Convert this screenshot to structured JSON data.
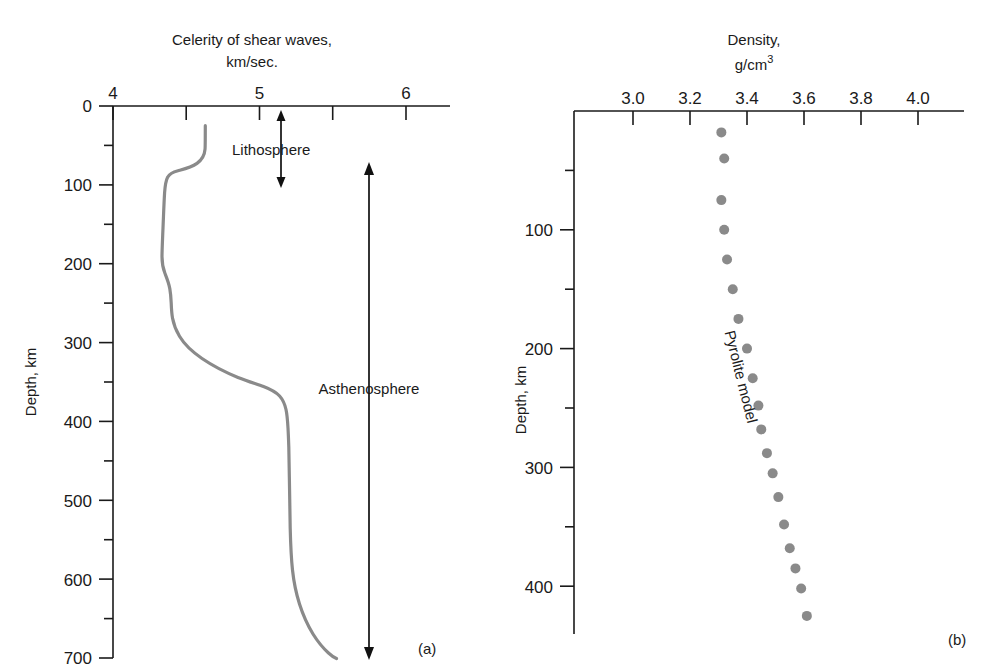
{
  "figure": {
    "panel_a_label": "(a)",
    "panel_b_label": "(b)"
  },
  "panel_a": {
    "title_line1": "Celerity of shear waves,",
    "title_line2": "km/sec.",
    "y_axis_label": "Depth, km",
    "x_ticks": [
      "4",
      "5",
      "6"
    ],
    "y_ticks": [
      "0",
      "100",
      "200",
      "300",
      "400",
      "500",
      "600",
      "700"
    ],
    "annotations": {
      "lithosphere": "Lithosphere",
      "asthenosphere": "Asthenosphere"
    }
  },
  "panel_b": {
    "title_line1": "Density,",
    "title_line2": "g/cm",
    "title_sup": "3",
    "y_axis_label": "Depth, km",
    "x_ticks": [
      "3.0",
      "3.2",
      "3.4",
      "3.6",
      "3.8",
      "4.0"
    ],
    "y_ticks": [
      "100",
      "200",
      "300",
      "400"
    ],
    "series_label": "Pyrolite model"
  },
  "colors": {
    "axis": "#1a1a1a",
    "curve": "#8a8a8a",
    "dot": "#8a8a8a",
    "background": "#ffffff"
  },
  "chart_data": [
    {
      "type": "line",
      "title": "Celerity of shear waves, km/sec.",
      "xlabel": "Celerity of shear waves, km/sec.",
      "ylabel": "Depth, km",
      "xlim": [
        4,
        6
      ],
      "ylim": [
        0,
        700
      ],
      "y_inverted": true,
      "grid": false,
      "legend": "none",
      "x_major_ticks": [
        4,
        5,
        6
      ],
      "x_minor_ticks": [
        4.5,
        5.5
      ],
      "y_major_ticks": [
        0,
        100,
        200,
        300,
        400,
        500,
        600,
        700
      ],
      "y_minor_ticks": [
        50,
        150,
        250,
        350,
        450,
        550,
        650
      ],
      "series": [
        {
          "name": "Shear wave velocity",
          "points": [
            [
              4.63,
              25
            ],
            [
              4.63,
              55
            ],
            [
              4.6,
              68
            ],
            [
              4.5,
              76
            ],
            [
              4.38,
              82
            ],
            [
              4.34,
              90
            ],
            [
              4.32,
              105
            ],
            [
              4.3,
              130
            ],
            [
              4.28,
              160
            ],
            [
              4.28,
              190
            ],
            [
              4.3,
              215
            ],
            [
              4.32,
              245
            ],
            [
              4.33,
              275
            ],
            [
              4.34,
              300
            ],
            [
              4.38,
              330
            ],
            [
              4.48,
              360
            ],
            [
              4.62,
              385
            ],
            [
              4.8,
              405
            ],
            [
              4.96,
              425
            ],
            [
              5.06,
              450
            ],
            [
              5.12,
              480
            ],
            [
              5.16,
              520
            ],
            [
              5.19,
              570
            ],
            [
              5.22,
              610
            ],
            [
              5.27,
              650
            ],
            [
              5.38,
              680
            ],
            [
              5.53,
              698
            ]
          ]
        }
      ],
      "annotations": [
        {
          "text": "Lithosphere",
          "depth_range": [
            0,
            80
          ]
        },
        {
          "text": "Asthenosphere",
          "depth_range": [
            80,
            700
          ]
        }
      ]
    },
    {
      "type": "scatter",
      "title": "Density, g/cm3",
      "xlabel": "Density, g/cm3",
      "ylabel": "Depth, km",
      "xlim": [
        2.9,
        4.1
      ],
      "ylim": [
        0,
        440
      ],
      "y_inverted": true,
      "grid": false,
      "legend": "none",
      "x_major_ticks": [
        3.0,
        3.2,
        3.4,
        3.6,
        3.8,
        4.0
      ],
      "y_major_ticks": [
        100,
        200,
        300,
        400
      ],
      "y_minor_ticks": [
        50,
        150,
        250,
        350
      ],
      "series": [
        {
          "name": "Pyrolite model",
          "x": [
            3.31,
            3.32,
            3.31,
            3.32,
            3.33,
            3.35,
            3.37,
            3.4,
            3.42,
            3.44,
            3.45,
            3.47,
            3.49,
            3.51,
            3.53,
            3.55,
            3.57,
            3.59,
            3.61
          ],
          "y": [
            18,
            40,
            75,
            100,
            125,
            150,
            175,
            200,
            225,
            248,
            268,
            288,
            305,
            325,
            348,
            368,
            385,
            402,
            425
          ]
        }
      ]
    }
  ]
}
